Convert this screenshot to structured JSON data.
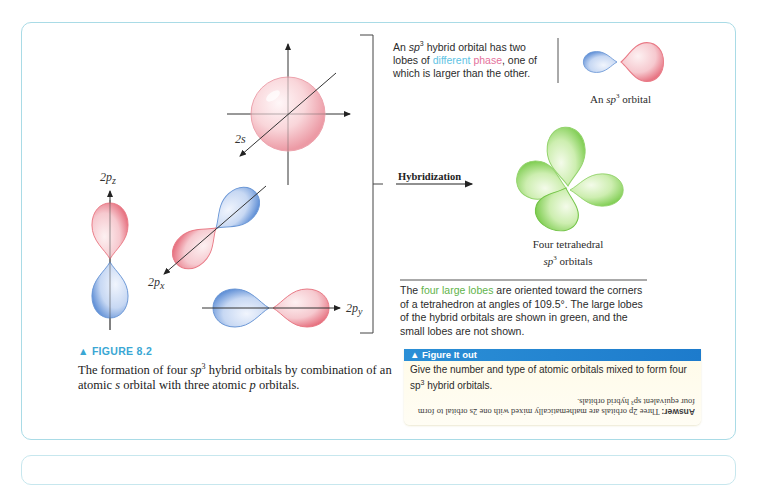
{
  "figure": {
    "tag": "▲ FIGURE 8.2",
    "caption_parts": {
      "a": "The formation of four ",
      "sp": "sp",
      "sup": "3",
      "b": " hybrid orbitals by combination of an atomic ",
      "s": "s",
      "c": " orbital with three atomic ",
      "p": "p",
      "d": " orbitals."
    }
  },
  "orbitals": {
    "s_label": "2s",
    "pz_label": "2p",
    "pz_sub": "z",
    "px_label": "2p",
    "px_sub": "x",
    "py_label": "2p",
    "py_sub": "y"
  },
  "hybridization_label": "Hybridization",
  "note_top": {
    "a": "An ",
    "sp": "sp",
    "sup": "3",
    "b": " hybrid orbital has two lobes of ",
    "different": "different",
    "space": " ",
    "phase": "phase",
    "c": ", one of which is larger than the other."
  },
  "sp3_orbital_label": {
    "a": "An ",
    "sp": "sp",
    "sup": "3",
    "b": " orbital"
  },
  "tetra_label": {
    "line1": "Four tetrahedral",
    "sp": "sp",
    "sup": "3",
    "b": " orbitals"
  },
  "note_bottom": {
    "a": "The ",
    "green": "four large lobes",
    "b": " are oriented toward the corners of a tetrahedron at angles of 109.5°. The large lobes of the hybrid orbitals are shown in green, and the small lobes are not shown."
  },
  "figure_it_out": {
    "header": "▲ Figure It out",
    "question_a": "Give the number and type of atomic orbitals mixed to form four ",
    "question_sp": "sp",
    "question_sup": "3",
    "question_b": " hybrid orbitals.",
    "answer_label": "Answer:",
    "answer_text": " Three 2p orbitals are mathematically mixed with one 2s orbital to form four equivalent sp³ hybrid orbitals."
  },
  "colors": {
    "frame": "#a9dbe6",
    "positive_phase": "#e97a86",
    "negative_phase": "#6b97d6",
    "hybrid": "#8fd46a",
    "figure_tag": "#3aa7d4",
    "fio_header": "#2186d2"
  }
}
